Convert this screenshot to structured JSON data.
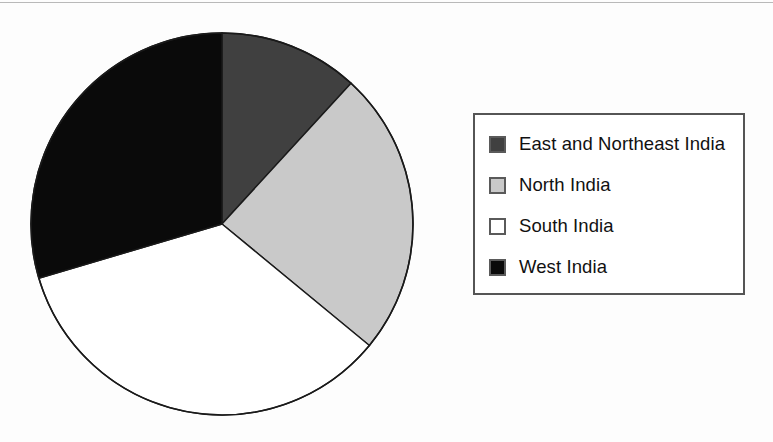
{
  "chart_data": {
    "type": "pie",
    "title": "",
    "legend_position": "right",
    "grid": false,
    "categories": [
      "East and Northeast India",
      "North India",
      "South India",
      "West India"
    ],
    "values": [
      11.8,
      24.2,
      34.4,
      29.6
    ],
    "start_angle_deg": 0,
    "direction": "clockwise",
    "slices": [
      {
        "label": "East and Northeast India",
        "value": 11.8,
        "start_angle_deg": 0,
        "end_angle_deg": 42.5,
        "color": "#404040"
      },
      {
        "label": "North India",
        "value": 24.2,
        "start_angle_deg": 42.5,
        "end_angle_deg": 129.5,
        "color": "#c9c9c9"
      },
      {
        "label": "South India",
        "value": 34.4,
        "start_angle_deg": 129.5,
        "end_angle_deg": 253.5,
        "color": "#ffffff"
      },
      {
        "label": "West India",
        "value": 29.6,
        "start_angle_deg": 253.5,
        "end_angle_deg": 360,
        "color": "#0a0a0a"
      }
    ],
    "geometry": {
      "center_x": 222,
      "center_y": 224,
      "radius": 191
    },
    "xlabel": "",
    "ylabel": ""
  },
  "legend": {
    "items": [
      {
        "label": "East and Northeast India",
        "swatch_color": "#404040",
        "swatch_name": "swatch-east-and-northeast-india"
      },
      {
        "label": "North India",
        "swatch_color": "#c9c9c9",
        "swatch_name": "swatch-north-india"
      },
      {
        "label": "South India",
        "swatch_color": "#ffffff",
        "swatch_name": "swatch-south-india"
      },
      {
        "label": "West India",
        "swatch_color": "#0a0a0a",
        "swatch_name": "swatch-west-india"
      }
    ]
  },
  "colors": {
    "dark_gray": "#404040",
    "light_gray": "#c9c9c9",
    "white": "#ffffff",
    "black": "#0a0a0a",
    "outline": "#1a1a1a",
    "legend_border": "#555555",
    "page_background": "#fdfdfd"
  }
}
